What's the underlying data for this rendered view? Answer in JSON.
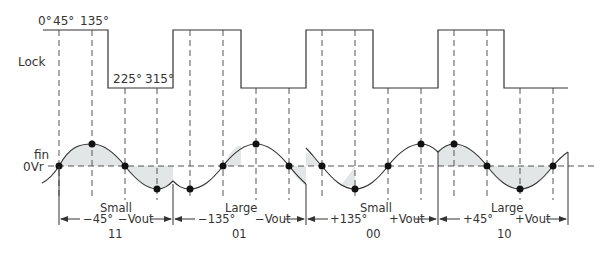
{
  "diagram": {
    "signals": {
      "lock": {
        "label": "Lock"
      },
      "fin": {
        "label": "fin"
      },
      "zero": {
        "label": "0Vr"
      }
    },
    "angle_labels": {
      "a0": "0°",
      "a45": "45°",
      "a135": "135°",
      "a225": "225°",
      "a315": "315°"
    },
    "segments": [
      {
        "amplitude": "Small",
        "phase": "−45°",
        "output": "−Vout",
        "code": "11"
      },
      {
        "amplitude": "Large",
        "phase": "−135°",
        "output": "−Vout",
        "code": "01"
      },
      {
        "amplitude": "Small",
        "phase": "+135°",
        "output": "+Vout",
        "code": "00"
      },
      {
        "amplitude": "Large",
        "phase": "+45°",
        "output": "+Vout",
        "code": "10"
      }
    ],
    "colors": {
      "line": "#333333",
      "shade": "#e3e6e6",
      "dash": "#555555"
    }
  }
}
